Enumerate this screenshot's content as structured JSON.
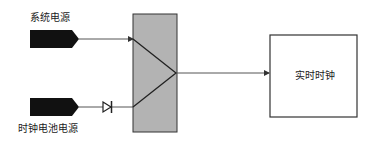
{
  "diagram": {
    "inputs": [
      {
        "label": "系统电源",
        "type": "connector"
      },
      {
        "label": "时钟电池电源",
        "type": "connector",
        "has_diode": true
      }
    ],
    "selector": {
      "shape": "mux",
      "fill": "#b3b3b3"
    },
    "output": {
      "label": "实时时钟"
    },
    "colors": {
      "connector": "#111111",
      "line": "#333333",
      "selector_fill": "#b3b3b3",
      "border": "#333333"
    }
  }
}
